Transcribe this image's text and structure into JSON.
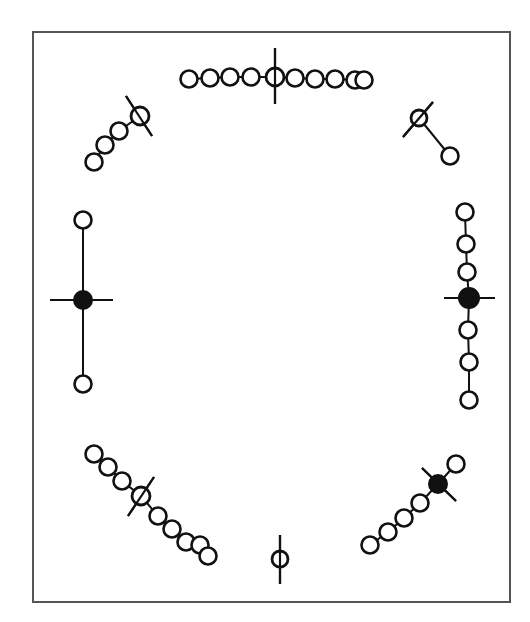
{
  "figure": {
    "frame": {
      "x": 33,
      "y": 32,
      "width": 477,
      "height": 570,
      "color": "#555555"
    },
    "ink_color": "#111111",
    "background": "#ffffff",
    "ring_radius": 8.5,
    "groups": [
      {
        "id": "top",
        "label": "horizontal chain of 9 rings with vertical spindle through center",
        "rings": [
          [
            189,
            79
          ],
          [
            210,
            78
          ],
          [
            230,
            77
          ],
          [
            251,
            77
          ],
          [
            295,
            78
          ],
          [
            315,
            79
          ],
          [
            335,
            79
          ],
          [
            355,
            80
          ],
          [
            364,
            80
          ]
        ],
        "core": {
          "x": 275,
          "y": 77,
          "type": "open",
          "r": 9
        },
        "spindle": [
          [
            275,
            48
          ],
          [
            275,
            104
          ]
        ]
      },
      {
        "id": "top-left",
        "label": "diagonal chain of 4 rings with crossing spindle",
        "rings": [
          [
            94,
            162
          ],
          [
            105,
            145
          ],
          [
            119,
            131
          ]
        ],
        "core": {
          "x": 140,
          "y": 116,
          "type": "open",
          "r": 9
        },
        "spindle": [
          [
            126,
            96
          ],
          [
            152,
            136
          ]
        ]
      },
      {
        "id": "top-right",
        "label": "single ring linked to crossed core",
        "rings": [
          [
            450,
            156
          ]
        ],
        "core": {
          "x": 419,
          "y": 118,
          "type": "open",
          "r": 8
        },
        "spindle": [
          [
            403,
            137
          ],
          [
            433,
            102
          ]
        ]
      },
      {
        "id": "left",
        "label": "two rings linked vertically through filled core with horizontal spindle",
        "rings": [
          [
            83,
            220
          ],
          [
            83,
            384
          ]
        ],
        "core": {
          "x": 83,
          "y": 300,
          "type": "filled",
          "r": 9
        },
        "spindle": [
          [
            50,
            300
          ],
          [
            113,
            300
          ]
        ]
      },
      {
        "id": "right",
        "label": "vertical chain of 7 rings with filled core and horizontal spindle",
        "rings": [
          [
            465,
            212
          ],
          [
            466,
            244
          ],
          [
            467,
            272
          ],
          [
            468,
            330
          ],
          [
            469,
            362
          ],
          [
            469,
            400
          ]
        ],
        "core": {
          "x": 469,
          "y": 298,
          "type": "filled",
          "r": 10
        },
        "spindle": [
          [
            444,
            298
          ],
          [
            495,
            298
          ]
        ]
      },
      {
        "id": "bottom-left",
        "label": "diagonal chain of 9 rings with crossing spindle",
        "rings": [
          [
            94,
            454
          ],
          [
            108,
            467
          ],
          [
            122,
            481
          ],
          [
            158,
            516
          ],
          [
            172,
            529
          ],
          [
            186,
            542
          ],
          [
            200,
            545
          ],
          [
            208,
            556
          ]
        ],
        "core": {
          "x": 141,
          "y": 496,
          "type": "open",
          "r": 9
        },
        "spindle": [
          [
            128,
            516
          ],
          [
            154,
            477
          ]
        ]
      },
      {
        "id": "bottom",
        "label": "single ring with vertical spindle",
        "rings": [],
        "core": {
          "x": 280,
          "y": 559,
          "type": "open",
          "r": 8
        },
        "spindle": [
          [
            280,
            535
          ],
          [
            280,
            584
          ]
        ]
      },
      {
        "id": "bottom-right",
        "label": "diagonal chain of 7 rings with filled core and crossing spindle",
        "rings": [
          [
            370,
            545
          ],
          [
            388,
            532
          ],
          [
            404,
            518
          ],
          [
            420,
            503
          ],
          [
            456,
            464
          ]
        ],
        "core": {
          "x": 438,
          "y": 484,
          "type": "filled",
          "r": 9
        },
        "spindle": [
          [
            422,
            468
          ],
          [
            456,
            501
          ]
        ]
      }
    ]
  }
}
